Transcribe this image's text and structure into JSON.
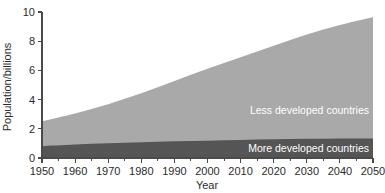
{
  "chart_data": {
    "type": "area",
    "title": "",
    "xlabel": "Year",
    "ylabel": "Population/billions",
    "xlim": [
      1950,
      2050
    ],
    "ylim": [
      0,
      10
    ],
    "grid": false,
    "stacked": true,
    "legend_position": "inside-right",
    "x": [
      1950,
      1960,
      1970,
      1980,
      1990,
      2000,
      2010,
      2020,
      2030,
      2040,
      2050
    ],
    "xticks": [
      "1950",
      "1960",
      "1970",
      "1980",
      "1990",
      "2000",
      "2010",
      "2020",
      "2030",
      "2040",
      "2050"
    ],
    "xtick_minor_step": 5,
    "yticks": [
      "0",
      "2",
      "4",
      "6",
      "8",
      "10"
    ],
    "ytick_values": [
      0,
      2,
      4,
      6,
      8,
      10
    ],
    "series": [
      {
        "name": "More developed countries",
        "color": "#555555",
        "values": [
          0.81,
          0.92,
          1.01,
          1.08,
          1.15,
          1.19,
          1.24,
          1.28,
          1.31,
          1.33,
          1.34
        ]
      },
      {
        "name": "Less developed countries",
        "color": "#a9a9a9",
        "values": [
          1.71,
          2.13,
          2.68,
          3.35,
          4.12,
          4.92,
          5.66,
          6.4,
          7.15,
          7.78,
          8.3
        ]
      }
    ],
    "totals": [
      2.52,
      3.05,
      3.69,
      4.43,
      5.27,
      6.11,
      6.9,
      7.68,
      8.46,
      9.11,
      9.64
    ],
    "annotations": [
      {
        "name": "less-developed-label",
        "text": "Less developed countries",
        "x": 2050,
        "y": 3.25
      },
      {
        "name": "more-developed-label",
        "text": "More developed countries",
        "x": 2050,
        "y": 0.62
      }
    ]
  },
  "colors": {
    "background": "#ffffff",
    "axis": "#4a4a4a",
    "text": "#2b2b2b",
    "label_text": "#ffffff",
    "less_developed": "#a9a9a9",
    "more_developed": "#555555"
  }
}
